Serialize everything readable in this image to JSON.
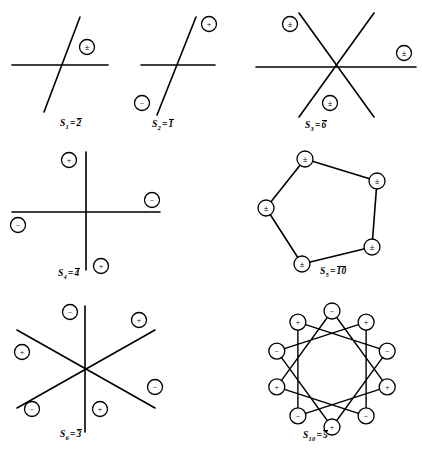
{
  "page": {
    "kind": "mathematical-figure-plate",
    "width": 422,
    "height": 453,
    "background": "#ffffff",
    "ink_color": "#000000"
  },
  "figures": [
    {
      "id": "s1",
      "caption": {
        "symbol": "S",
        "subscript": "1",
        "equals": "=",
        "value": "2",
        "overbar": true,
        "text": "S1 = 2̅"
      },
      "center": {
        "x": 62,
        "y": 62
      },
      "lines": [
        {
          "name": "horizontal-mirror-line",
          "x1": 12,
          "y1": 65,
          "x2": 108,
          "y2": 65
        },
        {
          "name": "steep-diagonal-line",
          "x1": 80,
          "y1": 17,
          "x2": 44,
          "y2": 112
        }
      ],
      "markers": [
        {
          "name": "pm-marker-right",
          "glyph": "±",
          "cx": 87,
          "cy": 47,
          "r": 7.5
        }
      ]
    },
    {
      "id": "s2",
      "caption": {
        "symbol": "S",
        "subscript": "2",
        "equals": "=",
        "value": "1",
        "overbar": true,
        "text": "S2 = 1̅"
      },
      "center": {
        "x": 178,
        "y": 63
      },
      "lines": [
        {
          "name": "horizontal-mirror-line",
          "x1": 141,
          "y1": 65,
          "x2": 215,
          "y2": 65
        },
        {
          "name": "steep-diagonal-line",
          "x1": 196,
          "y1": 17,
          "x2": 157,
          "y2": 115
        }
      ],
      "markers": [
        {
          "name": "plus-marker-upper-right",
          "glyph": "+",
          "cx": 209,
          "cy": 24,
          "r": 7.5
        },
        {
          "name": "minus-marker-lower-left",
          "glyph": "−",
          "cx": 142,
          "cy": 103,
          "r": 7.5
        }
      ]
    },
    {
      "id": "s3",
      "caption": {
        "symbol": "S",
        "subscript": "3",
        "equals": "=",
        "value": "6",
        "overbar": true,
        "text": "S3 = 6̅"
      },
      "center": {
        "x": 336,
        "y": 67
      },
      "lines": [
        {
          "name": "horizontal-mirror-line",
          "x1": 256,
          "y1": 67,
          "x2": 416,
          "y2": 67
        },
        {
          "name": "diagonal-line-nw-se",
          "x1": 299,
          "y1": 13,
          "x2": 374,
          "y2": 117
        },
        {
          "name": "diagonal-line-ne-sw",
          "x1": 374,
          "y1": 13,
          "x2": 299,
          "y2": 117
        }
      ],
      "markers": [
        {
          "name": "pm-marker-upper-left",
          "glyph": "±",
          "cx": 290,
          "cy": 24,
          "r": 7.5
        },
        {
          "name": "pm-marker-right",
          "glyph": "±",
          "cx": 404,
          "cy": 53,
          "r": 7.5
        },
        {
          "name": "pm-marker-bottom",
          "glyph": "±",
          "cx": 330,
          "cy": 103,
          "r": 7.5
        }
      ]
    },
    {
      "id": "s4",
      "caption": {
        "symbol": "S",
        "subscript": "4",
        "equals": "=",
        "value": "4",
        "overbar": true,
        "text": "S4 = 4̅"
      },
      "center": {
        "x": 86,
        "y": 212
      },
      "lines": [
        {
          "name": "vertical-axis-line",
          "x1": 86,
          "y1": 152,
          "x2": 86,
          "y2": 270
        },
        {
          "name": "horizontal-axis-line",
          "x1": 12,
          "y1": 212,
          "x2": 160,
          "y2": 212
        }
      ],
      "markers": [
        {
          "name": "plus-marker-upper-left",
          "glyph": "+",
          "cx": 69,
          "cy": 160,
          "r": 7.5
        },
        {
          "name": "minus-marker-upper-right",
          "glyph": "−",
          "cx": 152,
          "cy": 200,
          "r": 7.5
        },
        {
          "name": "minus-marker-left",
          "glyph": "−",
          "cx": 18,
          "cy": 225,
          "r": 7.5
        },
        {
          "name": "plus-marker-lower-right",
          "glyph": "+",
          "cx": 101,
          "cy": 266,
          "r": 7.5
        }
      ]
    },
    {
      "id": "s5",
      "caption": {
        "symbol": "S",
        "subscript": "5",
        "equals": "=",
        "value": "10",
        "overbar": true,
        "text": "S5 = 1̅0̅"
      },
      "center": {
        "x": 330,
        "y": 210
      },
      "polygon": {
        "name": "pentagon-outline",
        "points": [
          {
            "x": 305,
            "y": 159,
            "marker": "pm"
          },
          {
            "x": 377,
            "y": 181,
            "marker": "pm"
          },
          {
            "x": 372,
            "y": 247,
            "marker": "pm"
          },
          {
            "x": 302,
            "y": 264,
            "marker": "pm"
          },
          {
            "x": 266,
            "y": 208,
            "marker": "pm"
          }
        ]
      },
      "markers": [
        {
          "name": "pm-marker-vertex-top",
          "glyph": "±",
          "cx": 305,
          "cy": 159,
          "r": 8
        },
        {
          "name": "pm-marker-vertex-upper-right",
          "glyph": "±",
          "cx": 377,
          "cy": 181,
          "r": 8
        },
        {
          "name": "pm-marker-vertex-lower-right",
          "glyph": "±",
          "cx": 372,
          "cy": 247,
          "r": 8
        },
        {
          "name": "pm-marker-vertex-bottom",
          "glyph": "±",
          "cx": 302,
          "cy": 264,
          "r": 8
        },
        {
          "name": "pm-marker-vertex-left",
          "glyph": "±",
          "cx": 266,
          "cy": 208,
          "r": 8
        }
      ]
    },
    {
      "id": "s6",
      "caption": {
        "symbol": "S",
        "subscript": "6",
        "equals": "=",
        "value": "3",
        "overbar": true,
        "text": "S6 = 3̅"
      },
      "center": {
        "x": 85,
        "y": 369
      },
      "lines": [
        {
          "name": "vertical-axis-line",
          "x1": 85,
          "y1": 306,
          "x2": 85,
          "y2": 432
        },
        {
          "name": "diagonal-line-nw-se",
          "x1": 17,
          "y1": 330,
          "x2": 155,
          "y2": 408
        },
        {
          "name": "diagonal-line-ne-sw",
          "x1": 155,
          "y1": 330,
          "x2": 17,
          "y2": 408
        }
      ],
      "markers": [
        {
          "name": "minus-marker-top",
          "glyph": "−",
          "cx": 70,
          "cy": 312,
          "r": 7.5
        },
        {
          "name": "plus-marker-upper-right",
          "glyph": "+",
          "cx": 139,
          "cy": 320,
          "r": 7.5
        },
        {
          "name": "plus-marker-left",
          "glyph": "+",
          "cx": 22,
          "cy": 352,
          "r": 7.5
        },
        {
          "name": "minus-marker-right",
          "glyph": "−",
          "cx": 155,
          "cy": 387,
          "r": 7.5
        },
        {
          "name": "minus-marker-lower-left",
          "glyph": "−",
          "cx": 32,
          "cy": 409,
          "r": 7.5
        },
        {
          "name": "plus-marker-bottom",
          "glyph": "+",
          "cx": 100,
          "cy": 409,
          "r": 7.5
        }
      ]
    },
    {
      "id": "s10",
      "caption": {
        "symbol": "S",
        "subscript": "10",
        "equals": "=",
        "value": "5",
        "overbar": true,
        "text": "S10 = 5̅"
      },
      "center": {
        "x": 332,
        "y": 369
      },
      "star": {
        "name": "decagram-outline",
        "vertices": 10,
        "radius": 58,
        "start_angle_deg": -90,
        "step": 3,
        "signs": [
          "−",
          "+",
          "−",
          "+",
          "−",
          "+",
          "−",
          "+",
          "−",
          "+"
        ]
      },
      "markers": [
        {
          "name": "minus-marker-vertex-0",
          "glyph": "−",
          "r": 8
        },
        {
          "name": "plus-marker-vertex-1",
          "glyph": "+",
          "r": 8
        },
        {
          "name": "minus-marker-vertex-2",
          "glyph": "−",
          "r": 8
        },
        {
          "name": "plus-marker-vertex-3",
          "glyph": "+",
          "r": 8
        },
        {
          "name": "minus-marker-vertex-4",
          "glyph": "−",
          "r": 8
        },
        {
          "name": "plus-marker-vertex-5",
          "glyph": "+",
          "r": 8
        },
        {
          "name": "minus-marker-vertex-6",
          "glyph": "−",
          "r": 8
        },
        {
          "name": "plus-marker-vertex-7",
          "glyph": "+",
          "r": 8
        },
        {
          "name": "minus-marker-vertex-8",
          "glyph": "−",
          "r": 8
        },
        {
          "name": "plus-marker-vertex-9",
          "glyph": "+",
          "r": 8
        }
      ]
    }
  ],
  "captions": {
    "s1": {
      "prefix": "S",
      "sub": "1",
      "eq": "=",
      "val": "2"
    },
    "s2": {
      "prefix": "S",
      "sub": "2",
      "eq": "=",
      "val": "1"
    },
    "s3": {
      "prefix": "S",
      "sub": "3",
      "eq": "=",
      "val": "6"
    },
    "s4": {
      "prefix": "S",
      "sub": "4",
      "eq": "=",
      "val": "4"
    },
    "s5": {
      "prefix": "S",
      "sub": "5",
      "eq": "=",
      "val": "10"
    },
    "s6": {
      "prefix": "S",
      "sub": "6",
      "eq": "=",
      "val": "3"
    },
    "s10": {
      "prefix": "S",
      "sub": "10",
      "eq": "=",
      "val": "5"
    }
  }
}
